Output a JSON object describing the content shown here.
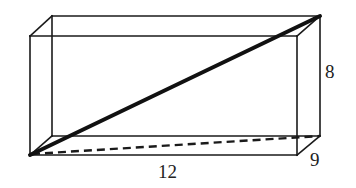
{
  "diagram": {
    "type": "rectangular-prism-wireframe",
    "dimensions": {
      "height_label": "8",
      "length_label": "12",
      "width_label": "9"
    },
    "colors": {
      "stroke": "#1a1a1a",
      "background": "#ffffff",
      "label": "#222222"
    },
    "vertices": {
      "front_top_left": [
        30,
        36
      ],
      "front_top_right": [
        297,
        36
      ],
      "front_bottom_left": [
        30,
        155
      ],
      "front_bottom_right": [
        297,
        155
      ],
      "back_top_left": [
        52,
        16
      ],
      "back_top_right": [
        320,
        16
      ],
      "back_bottom_left": [
        52,
        136
      ],
      "back_bottom_right": [
        320,
        136
      ]
    },
    "space_diagonal": {
      "from": "front_bottom_left",
      "to": "back_top_right",
      "style": "thick-solid"
    },
    "base_diagonal": {
      "from": "front_bottom_left",
      "to": "back_bottom_right",
      "style": "dashed"
    }
  }
}
